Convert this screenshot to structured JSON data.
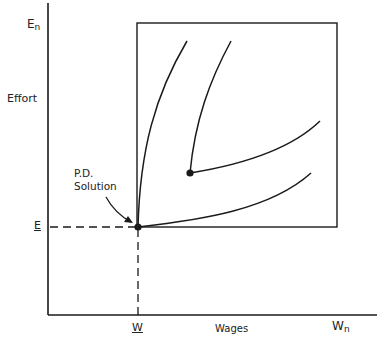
{
  "diagram": {
    "y_axis": {
      "title": "Effort",
      "top_label": "E",
      "top_label_sub": "n",
      "marked_value": "E"
    },
    "x_axis": {
      "title": "Wages",
      "right_label": "W",
      "right_label_sub": "n",
      "marked_value": "W"
    },
    "annotation": {
      "line1": "P.D.",
      "line2": "Solution"
    },
    "colors": {
      "ink": "#1a1a1a",
      "background": "#ffffff"
    },
    "elements": {
      "box": "feasible-region-rectangle",
      "curves": 4,
      "points": 2
    }
  }
}
